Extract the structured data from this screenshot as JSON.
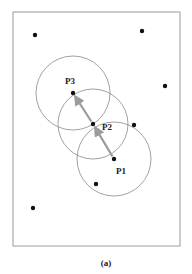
{
  "figure": {
    "caption": "(a)",
    "frame": {
      "x": 13,
      "y": 12,
      "width": 167,
      "height": 234,
      "stroke": "#9a9a9a"
    },
    "point_color": "#111111",
    "circle_color": "#8a8a8a",
    "arrow_color": "#9c9c9c",
    "labeled_points": [
      {
        "id": "P1",
        "label": "P1",
        "x": 114,
        "y": 159,
        "r": 37,
        "label_x": 116,
        "label_y": 174
      },
      {
        "id": "P2",
        "label": "P2",
        "x": 93,
        "y": 124,
        "r": 35,
        "label_x": 102,
        "label_y": 130
      },
      {
        "id": "P3",
        "label": "P3",
        "x": 73,
        "y": 93,
        "r": 37,
        "label_x": 65,
        "label_y": 84
      }
    ],
    "other_points": [
      {
        "x": 35,
        "y": 35
      },
      {
        "x": 142,
        "y": 31
      },
      {
        "x": 165,
        "y": 86
      },
      {
        "x": 134,
        "y": 125
      },
      {
        "x": 96,
        "y": 184
      },
      {
        "x": 33,
        "y": 208
      }
    ],
    "arrows": [
      {
        "from": "P1",
        "to": "P2"
      },
      {
        "from": "P2",
        "to": "P3"
      }
    ]
  }
}
